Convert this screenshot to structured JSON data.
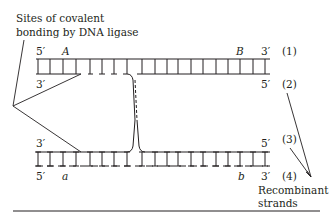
{
  "figure": {
    "annotation_top_left": {
      "line1": "Sites of covalent",
      "line2": "bonding by DNA ligase"
    },
    "annotation_bottom_right": {
      "line1": "Recombinant",
      "line2": "strands"
    },
    "top_duplex": {
      "upper_strand": {
        "end_left": "5′",
        "end_right": "3′",
        "number": "(1)",
        "marker_left": "A",
        "marker_right": "B"
      },
      "lower_strand": {
        "end_left": "3′",
        "end_right": "5′",
        "number": "(2)"
      }
    },
    "bottom_duplex": {
      "upper_strand": {
        "end_left": "3′",
        "end_right": "5′",
        "number": "(3)"
      },
      "lower_strand": {
        "end_left": "5′",
        "end_right": "3′",
        "number": "(4)",
        "marker_left": "a",
        "marker_right": "b"
      }
    },
    "colors": {
      "ink": "#231f20",
      "background": "#ffffff"
    }
  }
}
